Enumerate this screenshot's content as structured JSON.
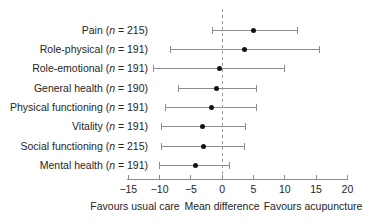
{
  "chart_data": {
    "type": "scatter",
    "subtype": "forest-plot",
    "title": "",
    "xlabel": "Mean difference",
    "x_left_caption": "Favours usual care",
    "x_right_caption": "Favours acupuncture",
    "xlim": [
      -15,
      20
    ],
    "x_ticks": [
      -15,
      -10,
      -5,
      0,
      5,
      10,
      15,
      20
    ],
    "zero_reference": 0,
    "grid": false,
    "legend": false,
    "rows": [
      {
        "label": "Pain",
        "n": 215,
        "mean": 5.0,
        "ci_low": -1.5,
        "ci_high": 12.0
      },
      {
        "label": "Role-physical",
        "n": 191,
        "mean": 3.6,
        "ci_low": -8.3,
        "ci_high": 15.6
      },
      {
        "label": "Role-emotional",
        "n": 191,
        "mean": -0.5,
        "ci_low": -11.0,
        "ci_high": 10.0
      },
      {
        "label": "General health",
        "n": 190,
        "mean": -0.9,
        "ci_low": -7.0,
        "ci_high": 5.4
      },
      {
        "label": "Physical functioning",
        "n": 191,
        "mean": -1.7,
        "ci_low": -9.1,
        "ci_high": 5.5
      },
      {
        "label": "Vitality",
        "n": 191,
        "mean": -3.1,
        "ci_low": -9.7,
        "ci_high": 3.7
      },
      {
        "label": "Social functioning",
        "n": 215,
        "mean": -3.0,
        "ci_low": -9.7,
        "ci_high": 3.5
      },
      {
        "label": "Mental health",
        "n": 191,
        "mean": -4.3,
        "ci_low": -10.0,
        "ci_high": 1.2
      }
    ]
  },
  "colors": {
    "point": "#141414",
    "interval_line": "#8c8c8c",
    "zero_line": "#9b9b9b",
    "text": "#262524",
    "background": "#ffffff"
  }
}
